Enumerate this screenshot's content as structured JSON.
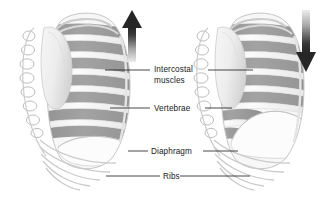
{
  "figure": {
    "background_color": "#ffffff",
    "width": 333,
    "height": 210
  },
  "palette": {
    "intercostal_muscle": "#9a9a9a",
    "intercostal_muscle_dark": "#8a8a8a",
    "bone_light": "#f4f4f4",
    "bone_outline": "#b9b9b9",
    "bone_shadow": "#dcdcdc",
    "diaphragm_fill": "#fbfbfb",
    "label_text": "#1a1a1a",
    "leader_line": "#1a1a1a",
    "arrow_dark": "#2b2b2b",
    "arrow_light": "#e8e8e8"
  },
  "labels": [
    {
      "id": "intercostal-muscles",
      "lines": [
        "Intercostal",
        "muscles"
      ],
      "line1": "Intercostal",
      "line2": "muscles",
      "x": 154,
      "y": 72
    },
    {
      "id": "vertebrae",
      "lines": [
        "Vertebrae"
      ],
      "line1": "Vertebrae",
      "x": 154,
      "y": 111
    },
    {
      "id": "diaphragm",
      "lines": [
        "Diaphragm"
      ],
      "line1": "Diaphragm",
      "x": 151,
      "y": 154
    },
    {
      "id": "ribs",
      "lines": [
        "Ribs"
      ],
      "line1": "Ribs",
      "x": 163,
      "y": 179
    }
  ],
  "arrows": [
    {
      "id": "inhale-arrow",
      "direction": "up",
      "meaning": "ribcage moves up and out during inhalation",
      "x": 132,
      "top": 10,
      "bottom": 62
    },
    {
      "id": "exhale-arrow",
      "direction": "down",
      "meaning": "ribcage moves down and in during exhalation",
      "x": 306,
      "top": 10,
      "bottom": 70
    }
  ],
  "figures": [
    {
      "id": "left-ribcage",
      "state": "inhalation",
      "diaphragm_position": "flattened / lowered",
      "rib_count": 12
    },
    {
      "id": "right-ribcage",
      "state": "exhalation",
      "diaphragm_position": "domed / raised",
      "rib_count": 12
    }
  ]
}
